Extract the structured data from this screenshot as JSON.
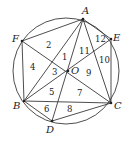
{
  "diagram": {
    "circle": {
      "cx": 66,
      "cy": 71,
      "r": 53
    },
    "points": [
      {
        "name": "A",
        "x": 83,
        "y": 19,
        "lx": 82,
        "ly": 14
      },
      {
        "name": "E",
        "x": 111,
        "y": 39,
        "lx": 113,
        "ly": 41
      },
      {
        "name": "C",
        "x": 111,
        "y": 103,
        "lx": 114,
        "ly": 109
      },
      {
        "name": "D",
        "x": 52,
        "y": 121,
        "lx": 46,
        "ly": 133
      },
      {
        "name": "B",
        "x": 24,
        "y": 101,
        "lx": 13,
        "ly": 109
      },
      {
        "name": "F",
        "x": 22,
        "y": 41,
        "lx": 12,
        "ly": 42
      },
      {
        "name": "O",
        "x": 68,
        "y": 71,
        "lx": 71,
        "ly": 74
      }
    ],
    "segments": [
      [
        "A",
        "F"
      ],
      [
        "A",
        "E"
      ],
      [
        "A",
        "B"
      ],
      [
        "A",
        "C"
      ],
      [
        "A",
        "D"
      ],
      [
        "E",
        "C"
      ],
      [
        "E",
        "B"
      ],
      [
        "F",
        "B"
      ],
      [
        "F",
        "C"
      ],
      [
        "B",
        "C"
      ],
      [
        "B",
        "D"
      ],
      [
        "D",
        "C"
      ]
    ],
    "region_labels": [
      {
        "text": "1",
        "x": 62,
        "y": 60
      },
      {
        "text": "2",
        "x": 46,
        "y": 48
      },
      {
        "text": "3",
        "x": 52,
        "y": 75
      },
      {
        "text": "4",
        "x": 30,
        "y": 70
      },
      {
        "text": "5",
        "x": 49,
        "y": 95
      },
      {
        "text": "6",
        "x": 44,
        "y": 112
      },
      {
        "text": "7",
        "x": 77,
        "y": 96
      },
      {
        "text": "8",
        "x": 67,
        "y": 112
      },
      {
        "text": "9",
        "x": 86,
        "y": 76
      },
      {
        "text": "10",
        "x": 99,
        "y": 63
      },
      {
        "text": "11",
        "x": 79,
        "y": 54
      },
      {
        "text": "12",
        "x": 95,
        "y": 42
      }
    ]
  }
}
